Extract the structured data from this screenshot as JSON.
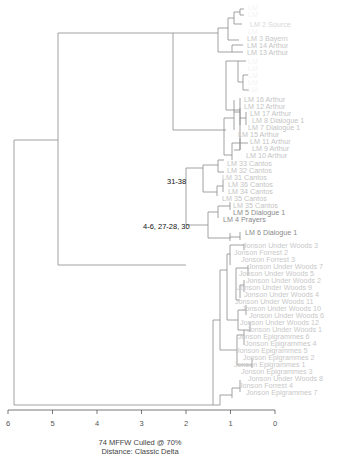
{
  "chart_data": {
    "type": "dendrogram",
    "orientation": "horizontal",
    "xlabel": "",
    "caption_lines": [
      "74 MFFW  Culled @ 70%",
      "Distance: Classic Delta"
    ],
    "xaxis": {
      "ticks": [
        6,
        5,
        4,
        3,
        2,
        1,
        0
      ],
      "range": [
        6,
        0
      ]
    },
    "annotations": [
      {
        "text": "31-38",
        "near_label": "LM 33 Cantos"
      },
      {
        "text": "4-6, 27-28, 30",
        "near_label": "LM 4 Prayers"
      }
    ],
    "leaves": [
      {
        "label": "",
        "y": 7,
        "color": "#f4f4f4"
      },
      {
        "label": "",
        "y": 14,
        "color": "#f4f4f4"
      },
      {
        "label": "LM 2 Source",
        "y": 24,
        "color": "#d8d8d8"
      },
      {
        "label": "",
        "y": 31,
        "color": "#f4f4f4"
      },
      {
        "label": "LM 3 Bayern",
        "y": 38,
        "color": "#c8c8c8"
      },
      {
        "label": "LM 14 Arthur",
        "y": 45,
        "color": "#c4c4c4"
      },
      {
        "label": "LM 13 Arthur",
        "y": 52,
        "color": "#c4c4c4"
      },
      {
        "label": "",
        "y": 61,
        "color": "#f4f4f4"
      },
      {
        "label": "",
        "y": 68,
        "color": "#f4f4f4"
      },
      {
        "label": "",
        "y": 75,
        "color": "#f4f4f4"
      },
      {
        "label": "",
        "y": 82,
        "color": "#f4f4f4"
      },
      {
        "label": "",
        "y": 89,
        "color": "#f4f4f4"
      },
      {
        "label": "LM 16 Arthur",
        "y": 99,
        "color": "#c4c4c4"
      },
      {
        "label": "LM 12 Arthur",
        "y": 106,
        "color": "#c4c4c4"
      },
      {
        "label": "LM 17 Arthur",
        "y": 113,
        "color": "#c4c4c4"
      },
      {
        "label": "LM 8 Dialogue 1",
        "y": 120,
        "color": "#c4c4c4"
      },
      {
        "label": "LM 7 Dialogue 1",
        "y": 127,
        "color": "#c4c4c4"
      },
      {
        "label": "LM 15 Arthur",
        "y": 134,
        "color": "#c4c4c4"
      },
      {
        "label": "LM 11 Arthur",
        "y": 141,
        "color": "#c4c4c4"
      },
      {
        "label": "LM 9 Arthur",
        "y": 148,
        "color": "#c4c4c4"
      },
      {
        "label": "LM 10 Arthur",
        "y": 155,
        "color": "#c4c4c4"
      },
      {
        "label": "LM 33 Cantos",
        "y": 163,
        "color": "#c4c4c4"
      },
      {
        "label": "LM 32 Cantos",
        "y": 170,
        "color": "#c4c4c4"
      },
      {
        "label": "LM 31 Cantos",
        "y": 177,
        "color": "#c4c4c4"
      },
      {
        "label": "LM 36 Cantos",
        "y": 184,
        "color": "#c4c4c4"
      },
      {
        "label": "LM 34 Cantos",
        "y": 191,
        "color": "#c4c4c4"
      },
      {
        "label": "LM 35 Cantos",
        "y": 198,
        "color": "#c4c4c4"
      },
      {
        "label": "LM 35 Cantos",
        "y": 205,
        "color": "#c4c4c4"
      },
      {
        "label": "LM 5 Dialogue 1",
        "y": 212,
        "color": "#8a8a8a"
      },
      {
        "label": "LM 4 Prayers",
        "y": 219,
        "color": "#8a8a8a"
      },
      {
        "label": "LM 6 Dialogue 1",
        "y": 232,
        "color": "#8a8a8a"
      },
      {
        "label": "Jonson Under Woods 3",
        "y": 245,
        "color": "#c8c8c8"
      },
      {
        "label": "Jonson Forrest 2",
        "y": 252,
        "color": "#c8c8c8"
      },
      {
        "label": "Jonson Forrest 3",
        "y": 259,
        "color": "#c8c8c8"
      },
      {
        "label": "Jonson Under Woods 7",
        "y": 266,
        "color": "#c8c8c8"
      },
      {
        "label": "Jonson Under Woods  5",
        "y": 273,
        "color": "#c8c8c8"
      },
      {
        "label": "Jonson Under Woods 2",
        "y": 280,
        "color": "#c8c8c8"
      },
      {
        "label": "Jonson Under Woods 9",
        "y": 287,
        "color": "#c8c8c8"
      },
      {
        "label": "Jonson Under Woods 4",
        "y": 294,
        "color": "#c8c8c8"
      },
      {
        "label": "Jonson Under Woods 11",
        "y": 301,
        "color": "#c8c8c8"
      },
      {
        "label": "Jonson  Under  Woods  10",
        "y": 308,
        "color": "#c8c8c8"
      },
      {
        "label": "Jonson Under Woods 6",
        "y": 315,
        "color": "#c8c8c8"
      },
      {
        "label": "Jonson  Under  Woods  12",
        "y": 322,
        "color": "#c8c8c8"
      },
      {
        "label": "Jonson Under Woods 1",
        "y": 329,
        "color": "#c8c8c8"
      },
      {
        "label": "Jonson Epigrammes 6",
        "y": 336,
        "color": "#c8c8c8"
      },
      {
        "label": "Jonson Epigrammes 4",
        "y": 343,
        "color": "#c8c8c8"
      },
      {
        "label": "Jonson Epigrammes 5",
        "y": 350,
        "color": "#c8c8c8"
      },
      {
        "label": "Jonson Epigrammes 2",
        "y": 357,
        "color": "#c8c8c8"
      },
      {
        "label": "Jonson Epigrammes 1",
        "y": 364,
        "color": "#c8c8c8"
      },
      {
        "label": "Jonson Epigrammes 3",
        "y": 371,
        "color": "#c8c8c8"
      },
      {
        "label": "Jonson Under Woods 8",
        "y": 378,
        "color": "#c8c8c8"
      },
      {
        "label": "Jonson Forrest 4",
        "y": 385,
        "color": "#c8c8c8"
      },
      {
        "label": "Jonson Epigrammes 7",
        "y": 392,
        "color": "#c8c8c8"
      }
    ]
  },
  "caption": {
    "line1": "74 MFFW  Culled @ 70%",
    "line2": "Distance: Classic Delta"
  }
}
